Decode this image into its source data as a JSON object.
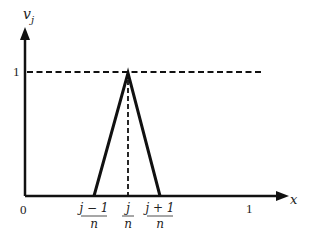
{
  "diagram": {
    "y_axis_label": "v",
    "y_axis_subscript": "j",
    "x_axis_label": "x",
    "y_tick_label": "1",
    "origin_label": "0",
    "x_tick_one": "1",
    "tick_left_num": "j − 1",
    "tick_left_den": "n",
    "tick_mid_num": "j",
    "tick_mid_den": "n",
    "tick_right_num": "j + 1",
    "tick_right_den": "n",
    "line_color": "#111111"
  }
}
